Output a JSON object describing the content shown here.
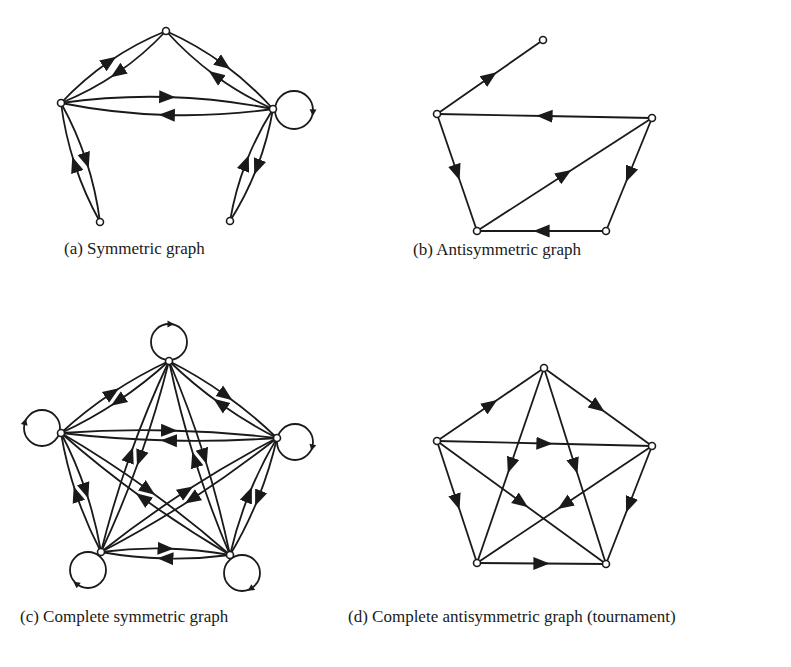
{
  "figure": {
    "panels": [
      {
        "id": "a",
        "caption": "(a) Symmetric graph",
        "caption_pos": [
          64,
          256
        ],
        "nodes": [
          [
            61,
            103
          ],
          [
            166,
            31
          ],
          [
            273,
            109
          ],
          [
            100,
            222
          ],
          [
            230,
            221
          ]
        ],
        "edges": [
          {
            "from": 0,
            "to": 1,
            "curve": -14
          },
          {
            "from": 1,
            "to": 0,
            "curve": -14
          },
          {
            "from": 1,
            "to": 2,
            "curve": -14
          },
          {
            "from": 2,
            "to": 1,
            "curve": -14
          },
          {
            "from": 0,
            "to": 2,
            "curve": -18
          },
          {
            "from": 2,
            "to": 0,
            "curve": -18
          },
          {
            "from": 0,
            "to": 3,
            "curve": -12
          },
          {
            "from": 3,
            "to": 0,
            "curve": -12
          },
          {
            "from": 2,
            "to": 4,
            "curve": -12
          },
          {
            "from": 4,
            "to": 2,
            "curve": -12
          }
        ],
        "loops": [
          {
            "node": 2,
            "cx": 294,
            "cy": 110,
            "r": 19
          }
        ]
      },
      {
        "id": "b",
        "caption": "(b) Antisymmetric graph",
        "caption_pos": [
          413,
          257
        ],
        "nodes": [
          [
            543,
            40
          ],
          [
            437,
            114
          ],
          [
            652,
            118
          ],
          [
            477,
            231
          ],
          [
            606,
            231
          ]
        ],
        "edges": [
          {
            "from": 1,
            "to": 0,
            "curve": 0
          },
          {
            "from": 2,
            "to": 1,
            "curve": 0
          },
          {
            "from": 1,
            "to": 3,
            "curve": 0
          },
          {
            "from": 3,
            "to": 2,
            "curve": 0
          },
          {
            "from": 2,
            "to": 4,
            "curve": 0
          },
          {
            "from": 4,
            "to": 3,
            "curve": 0
          }
        ],
        "loops": []
      },
      {
        "id": "c",
        "caption": "(c) Complete symmetric graph",
        "caption_pos": [
          20,
          624
        ],
        "nodes": [
          [
            169,
            361
          ],
          [
            61,
            433
          ],
          [
            277,
            438
          ],
          [
            101,
            552
          ],
          [
            230,
            555
          ]
        ],
        "symmetric_complete": true,
        "loops": [
          {
            "node": 0,
            "cx": 169,
            "cy": 342,
            "r": 18
          },
          {
            "node": 1,
            "cx": 42,
            "cy": 428,
            "r": 18
          },
          {
            "node": 2,
            "cx": 295,
            "cy": 442,
            "r": 18
          },
          {
            "node": 3,
            "cx": 88,
            "cy": 570,
            "r": 18
          },
          {
            "node": 4,
            "cx": 242,
            "cy": 573,
            "r": 18
          }
        ]
      },
      {
        "id": "d",
        "caption": "(d) Complete antisymmetric graph (tournament)",
        "caption_pos": [
          348,
          624
        ],
        "nodes": [
          [
            544,
            368
          ],
          [
            437,
            441
          ],
          [
            652,
            446
          ],
          [
            477,
            563
          ],
          [
            606,
            564
          ]
        ],
        "edges": [
          {
            "from": 1,
            "to": 0
          },
          {
            "from": 0,
            "to": 2
          },
          {
            "from": 1,
            "to": 2
          },
          {
            "from": 0,
            "to": 3
          },
          {
            "from": 0,
            "to": 4
          },
          {
            "from": 1,
            "to": 3
          },
          {
            "from": 1,
            "to": 4
          },
          {
            "from": 2,
            "to": 3
          },
          {
            "from": 2,
            "to": 4
          },
          {
            "from": 3,
            "to": 4
          }
        ],
        "loops": []
      }
    ]
  }
}
